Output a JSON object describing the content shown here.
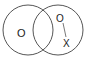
{
  "diagram": {
    "type": "venn",
    "circles": [
      {
        "id": "left",
        "cx": 28,
        "cy": 30,
        "r": 25
      },
      {
        "id": "right",
        "cx": 58,
        "cy": 30,
        "r": 25
      }
    ],
    "labels": {
      "left_symbol": "O",
      "right_top_symbol": "O",
      "right_bottom_symbol": "X"
    },
    "stroke_color": "#555555"
  }
}
